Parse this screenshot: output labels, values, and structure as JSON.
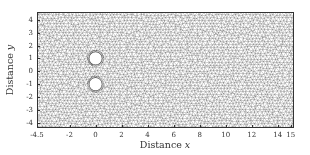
{
  "figure": {
    "type": "triangular-mesh",
    "colors": {
      "mesh_line": "#555555",
      "frame": "#333333",
      "background": "#ffffff",
      "hole_fill": "#ffffff"
    }
  },
  "axes": {
    "xlabel_prefix": "Distance ",
    "xlabel_var": "x",
    "ylabel_prefix": "Distance ",
    "ylabel_var": "y",
    "xlim": [
      -4.5,
      15.25
    ],
    "ylim": [
      -4.4,
      4.6
    ],
    "xticks": [
      {
        "value": -4.5,
        "label": "-4.5"
      },
      {
        "value": -2,
        "label": "-2"
      },
      {
        "value": 0,
        "label": "0"
      },
      {
        "value": 2,
        "label": "2"
      },
      {
        "value": 4,
        "label": "4"
      },
      {
        "value": 6,
        "label": "6"
      },
      {
        "value": 8,
        "label": "8"
      },
      {
        "value": 10,
        "label": "10"
      },
      {
        "value": 12,
        "label": "12"
      },
      {
        "value": 14,
        "label": "14"
      },
      {
        "value": 15,
        "label": "15"
      }
    ],
    "yticks": [
      {
        "value": 4,
        "label": "4"
      },
      {
        "value": 3,
        "label": "3"
      },
      {
        "value": 2,
        "label": "2"
      },
      {
        "value": 1,
        "label": "1"
      },
      {
        "value": 0,
        "label": "0"
      },
      {
        "value": -1,
        "label": "-1"
      },
      {
        "value": -2,
        "label": "-2"
      },
      {
        "value": -3,
        "label": "-3"
      },
      {
        "value": -4,
        "label": "-4"
      }
    ]
  },
  "holes": [
    {
      "name": "upper-cylinder",
      "cx": 0,
      "cy": 1,
      "r": 0.5
    },
    {
      "name": "lower-cylinder",
      "cx": 0,
      "cy": -1,
      "r": 0.5
    }
  ]
}
